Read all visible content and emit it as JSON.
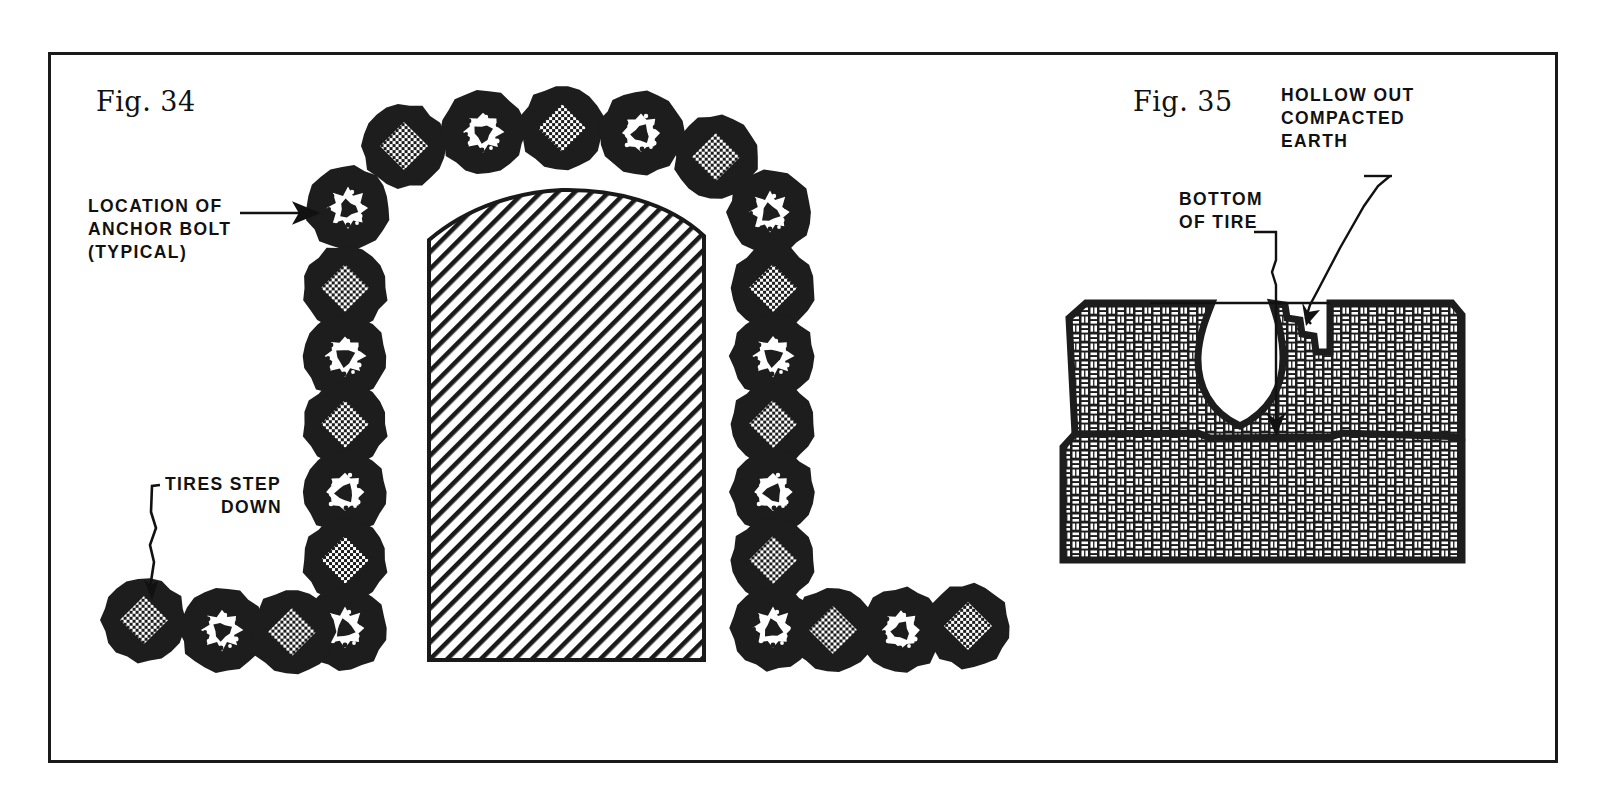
{
  "sheet": {
    "background_color": "#ffffff",
    "frame_color": "#1a1a1a",
    "ink_color": "#111111"
  },
  "figures": [
    {
      "id": "fig34",
      "caption": "Fig. 34",
      "description": "Plan view of a tire wall arch with anchor bolt locations",
      "annotations": [
        {
          "id": "anchor",
          "lines": [
            "LOCATION OF",
            "ANCHOR BOLT",
            "(TYPICAL)"
          ]
        },
        {
          "id": "step",
          "lines": [
            "TIRES STEP",
            "DOWN"
          ]
        }
      ]
    },
    {
      "id": "fig35",
      "caption": "Fig. 35",
      "description": "Section through two tire courses showing hollowed out compacted earth",
      "annotations": [
        {
          "id": "bottom",
          "lines": [
            "BOTTOM",
            "OF TIRE"
          ]
        },
        {
          "id": "hollow",
          "lines": [
            "HOLLOW OUT",
            "COMPACTED",
            "EARTH"
          ]
        }
      ]
    }
  ],
  "fig34": {
    "caption": "Fig. 34",
    "note_anchor": {
      "line1": "LOCATION OF",
      "line2": "ANCHOR BOLT",
      "line3": "(TYPICAL)"
    },
    "note_step": {
      "line1": "TIRES STEP",
      "line2": "DOWN"
    },
    "tire": {
      "outer_radius": 42,
      "ring_color": "#1d1d1d",
      "plain_center_label": "plain compacted earth center",
      "bolt_center_label": "anchor bolt center"
    },
    "tires": [
      {
        "cx": 348,
        "cy": 208,
        "type": "bolt"
      },
      {
        "cx": 404,
        "cy": 146,
        "type": "plain"
      },
      {
        "cx": 483,
        "cy": 132,
        "type": "bolt"
      },
      {
        "cx": 562,
        "cy": 128,
        "type": "plain"
      },
      {
        "cx": 641,
        "cy": 133,
        "type": "bolt"
      },
      {
        "cx": 716,
        "cy": 157,
        "type": "plain"
      },
      {
        "cx": 770,
        "cy": 212,
        "type": "bolt"
      },
      {
        "cx": 345,
        "cy": 288,
        "type": "plain"
      },
      {
        "cx": 345,
        "cy": 356,
        "type": "bolt"
      },
      {
        "cx": 345,
        "cy": 424,
        "type": "plain"
      },
      {
        "cx": 345,
        "cy": 492,
        "type": "bolt"
      },
      {
        "cx": 345,
        "cy": 560,
        "type": "plain"
      },
      {
        "cx": 345,
        "cy": 628,
        "type": "bolt"
      },
      {
        "cx": 773,
        "cy": 288,
        "type": "plain"
      },
      {
        "cx": 773,
        "cy": 356,
        "type": "bolt"
      },
      {
        "cx": 773,
        "cy": 424,
        "type": "plain"
      },
      {
        "cx": 773,
        "cy": 492,
        "type": "bolt"
      },
      {
        "cx": 773,
        "cy": 560,
        "type": "plain"
      },
      {
        "cx": 773,
        "cy": 628,
        "type": "bolt"
      },
      {
        "cx": 144,
        "cy": 620,
        "type": "plain"
      },
      {
        "cx": 222,
        "cy": 630,
        "type": "bolt"
      },
      {
        "cx": 292,
        "cy": 632,
        "type": "plain"
      },
      {
        "cx": 833,
        "cy": 630,
        "type": "plain"
      },
      {
        "cx": 901,
        "cy": 630,
        "type": "bolt"
      },
      {
        "cx": 968,
        "cy": 626,
        "type": "plain"
      }
    ],
    "hatched_block": {
      "label": "compacted earth fill with diagonal hatch",
      "hatch_angle_deg": 45,
      "hatch_color": "#1a1a1a"
    }
  },
  "fig35": {
    "caption": "Fig. 35",
    "note_bottom": {
      "line1": "BOTTOM",
      "line2": "OF TIRE"
    },
    "note_hollow": {
      "line1": "HOLLOW OUT",
      "line2": "COMPACTED",
      "line3": "EARTH"
    },
    "courses": [
      {
        "id": "upper-course",
        "label": "upper tire course with hollowed cavity"
      },
      {
        "id": "lower-course",
        "label": "lower tire course, solid compacted earth"
      }
    ],
    "fill": {
      "pattern": "basketweave-brick",
      "background_color": "#1d1d1d",
      "brick_color": "#ffffff"
    },
    "cavity": {
      "label": "hollowed out void",
      "color": "#ffffff"
    }
  },
  "icons": {
    "arrow_head": "arrow-head-icon",
    "leader_line": "leader-line-icon"
  }
}
